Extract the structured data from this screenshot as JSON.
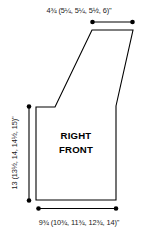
{
  "diagram": {
    "type": "garment-schematic",
    "piece_label_line1": "RIGHT",
    "piece_label_line2": "FRONT",
    "dimensions": {
      "top_width": {
        "base": "4",
        "base_frac_num": "3",
        "base_frac_den": "4",
        "full_text": "4¾ (5¼, 5¼, 5½, 6)\"",
        "sizes": [
          "4¾",
          "5¼",
          "5¼",
          "5½",
          "6"
        ],
        "unit": "\""
      },
      "left_height": {
        "full_text": "13 (13½, 14, 14½, 15)\"",
        "sizes": [
          "13",
          "13½",
          "14",
          "14½",
          "15"
        ],
        "unit": "\""
      },
      "bottom_width": {
        "full_text": "9¾ (10¾, 11¾, 12¾, 14)\"",
        "sizes": [
          "9¾",
          "10¾",
          "11¾",
          "12¾",
          "14"
        ],
        "unit": "\""
      }
    },
    "colors": {
      "outline": "#000000",
      "text": "#1a1a1a",
      "background": "#ffffff"
    }
  }
}
